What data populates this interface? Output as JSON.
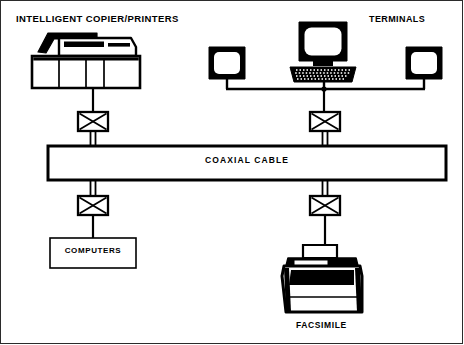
{
  "diagram": {
    "background_color": "#ffffff",
    "line_color": "#000000",
    "frame_color": "#2b2b2b"
  },
  "labels": {
    "copiers": "INTELLIGENT COPIER/PRINTERS",
    "terminals": "TERMINALS",
    "coaxial_cable": "COAXIAL CABLE",
    "computers": "COMPUTERS",
    "facsimile": "FACSIMILE"
  },
  "nodes": [
    {
      "id": "copier",
      "icon": "copier-printer-icon",
      "label": "INTELLIGENT COPIER/PRINTERS",
      "side": "top-left"
    },
    {
      "id": "terminals",
      "icon": "terminal-cluster-icon",
      "label": "TERMINALS",
      "side": "top-right"
    },
    {
      "id": "computers",
      "icon": "computers-box",
      "label": "COMPUTERS",
      "side": "bottom-left"
    },
    {
      "id": "facsimile",
      "icon": "facsimile-machine-icon",
      "label": "FACSIMILE",
      "side": "bottom-right"
    }
  ],
  "bus": {
    "name": "COAXIAL CABLE",
    "orientation": "horizontal",
    "taps": 4
  },
  "taps": [
    {
      "id": "tap-copier",
      "symbol": "crossed-box",
      "connects": "copier",
      "position": "upper-left"
    },
    {
      "id": "tap-terminals",
      "symbol": "crossed-box",
      "connects": "terminals",
      "position": "upper-right"
    },
    {
      "id": "tap-computers",
      "symbol": "crossed-box",
      "connects": "computers",
      "position": "lower-left"
    },
    {
      "id": "tap-facsimile",
      "symbol": "crossed-box",
      "connects": "facsimile",
      "position": "lower-right"
    }
  ],
  "terminals_cluster": {
    "devices": [
      "monitor-left",
      "workstation-center",
      "monitor-right"
    ],
    "count": 3
  }
}
